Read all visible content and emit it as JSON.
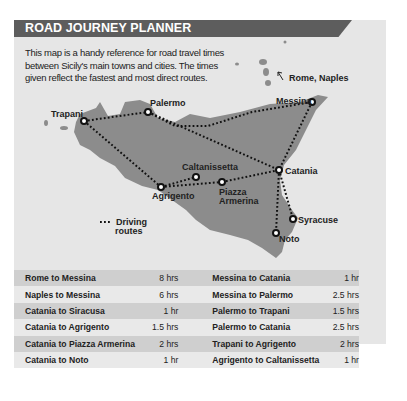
{
  "header": {
    "title": "ROAD JOURNEY PLANNER"
  },
  "intro": "This map is a handy reference for road travel times between Sicily's main towns and cities. The times given reflect the fastest and most direct routes.",
  "map": {
    "external_label": "Rome, Naples",
    "cities": {
      "trapani": "Trapani",
      "palermo": "Palermo",
      "messina": "Messina",
      "caltanissetta": "Caltanissetta",
      "catania": "Catania",
      "agrigento": "Agrigento",
      "piazza_armerina_1": "Piazza",
      "piazza_armerina_2": "Armerina",
      "syracuse": "Syracuse",
      "noto": "Noto"
    },
    "legend": {
      "line1": "Driving",
      "line2": "routes"
    },
    "colors": {
      "land": "#8c8c8c",
      "sea": "#e6e6e6",
      "header": "#5d5d5d"
    }
  },
  "table": {
    "rows": [
      {
        "left_route": "Rome to Messina",
        "left_time": "8 hrs",
        "right_route": "Messina to Catania",
        "right_time": "1 hr"
      },
      {
        "left_route": "Naples to Messina",
        "left_time": "6 hrs",
        "right_route": "Messina to Palermo",
        "right_time": "2.5 hrs"
      },
      {
        "left_route": "Catania to Siracusa",
        "left_time": "1 hr",
        "right_route": "Palermo to Trapani",
        "right_time": "1.5 hrs"
      },
      {
        "left_route": "Catania to Agrigento",
        "left_time": "1.5 hrs",
        "right_route": "Palermo to Catania",
        "right_time": "2.5 hrs"
      },
      {
        "left_route": "Catania to Piazza Armerina",
        "left_time": "2 hrs",
        "right_route": "Trapani to Agrigento",
        "right_time": "2 hrs"
      },
      {
        "left_route": "Catania to Noto",
        "left_time": "1 hr",
        "right_route": "Agrigento to Caltanissetta",
        "right_time": "1 hr"
      }
    ]
  }
}
